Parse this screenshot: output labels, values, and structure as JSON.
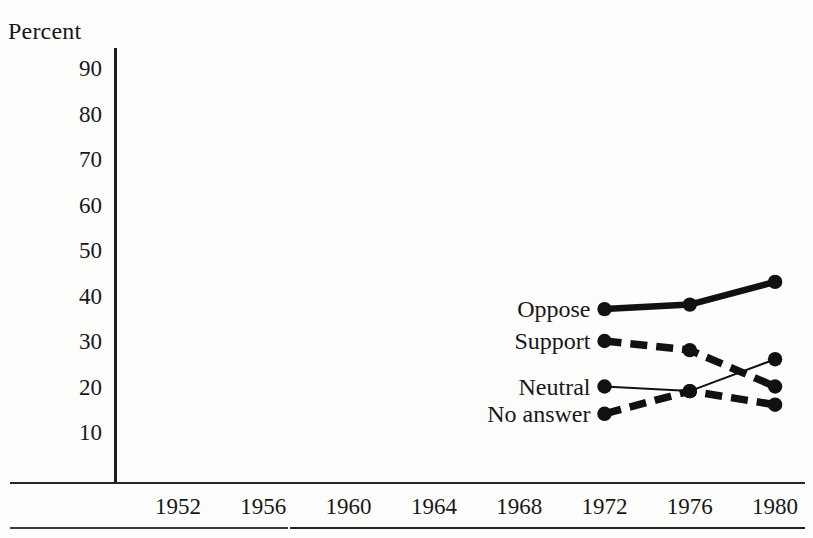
{
  "chart_data": {
    "type": "line",
    "title": "",
    "subtitle": "",
    "xlabel": "",
    "ylabel": "Percent",
    "x": [
      1972,
      1976,
      1980
    ],
    "categories": [
      "1972",
      "1976",
      "1980"
    ],
    "axis_tick_labels": {
      "x": [
        "1952",
        "1956",
        "1960",
        "1964",
        "1968",
        "1972",
        "1976",
        "1980"
      ],
      "y": [
        "90",
        "80",
        "70",
        "60",
        "50",
        "40",
        "30",
        "20",
        "10"
      ]
    },
    "xlim": [
      1950,
      1982
    ],
    "ylim": [
      0,
      95
    ],
    "yticks": [
      90,
      80,
      70,
      60,
      50,
      40,
      30,
      20,
      10
    ],
    "grid": false,
    "legend_position": "inline-left-of-first-point",
    "series": [
      {
        "name": "Oppose",
        "label": "Oppose",
        "values": [
          37,
          38,
          43
        ],
        "style": "solid-thick",
        "color": "#111113",
        "marker": "filled-circle"
      },
      {
        "name": "Support",
        "label": "Support",
        "values": [
          30,
          28,
          20
        ],
        "style": "dashed-thick",
        "color": "#111113",
        "marker": "filled-circle"
      },
      {
        "name": "Neutral",
        "label": "Neutral",
        "values": [
          20,
          19,
          26
        ],
        "style": "solid-thin",
        "color": "#111113",
        "marker": "filled-circle"
      },
      {
        "name": "No answer",
        "label": "No answer",
        "values": [
          14,
          19,
          16
        ],
        "style": "dashed-thick",
        "color": "#111113",
        "marker": "filled-circle"
      }
    ]
  }
}
